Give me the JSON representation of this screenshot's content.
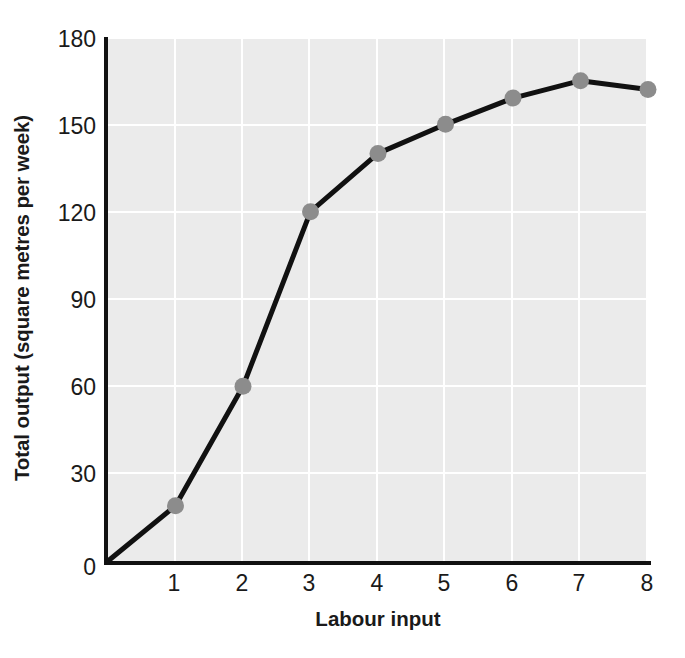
{
  "chart_data": {
    "type": "line",
    "title": "",
    "xlabel": "Labour input",
    "ylabel": "Total output (square metres per week)",
    "x": [
      0,
      1,
      2,
      3,
      4,
      5,
      6,
      7,
      8
    ],
    "values": [
      0,
      19,
      60,
      120,
      140,
      150,
      159,
      165,
      162
    ],
    "series": [
      {
        "name": "Total output",
        "values": [
          0,
          19,
          60,
          120,
          140,
          150,
          159,
          165,
          162
        ]
      }
    ],
    "markers_at_x": [
      1,
      2,
      3,
      4,
      5,
      6,
      7,
      8
    ],
    "xlim": [
      0,
      8
    ],
    "ylim": [
      0,
      180
    ],
    "xticks": [
      "0",
      "1",
      "2",
      "3",
      "4",
      "5",
      "6",
      "7",
      "8"
    ],
    "yticks": [
      "0",
      "30",
      "60",
      "90",
      "120",
      "150",
      "180"
    ],
    "grid": true,
    "legend": "none",
    "colors": {
      "plot_background": "#ebebeb",
      "gridline": "#ffffff",
      "line": "#111111",
      "marker": "#8c8c8c",
      "axis": "#111111",
      "text": "#1a1a1a",
      "page_background": "#ffffff"
    }
  }
}
